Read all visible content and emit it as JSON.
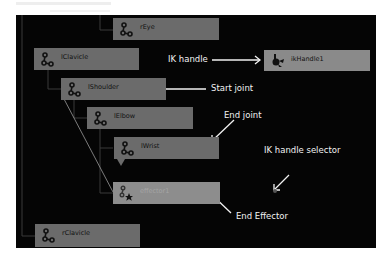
{
  "nodes": {
    "rEye": {
      "label": "rEye",
      "icon": "joint-icon"
    },
    "lClavicle": {
      "label": "lClavicle",
      "icon": "joint-icon"
    },
    "lShoulder": {
      "label": "lShoulder",
      "icon": "joint-icon"
    },
    "lElbow": {
      "label": "lElbow",
      "icon": "joint-icon"
    },
    "lWrist": {
      "label": "lWrist",
      "icon": "joint-icon"
    },
    "effector1": {
      "label": "effector1",
      "icon": "effector-icon"
    },
    "rClavicle": {
      "label": "rClavicle",
      "icon": "joint-icon"
    },
    "ikHandle1": {
      "label": "ikHandle1",
      "icon": "ik-handle-icon"
    }
  },
  "annotations": {
    "ik_handle": "IK handle",
    "start_joint": "Start joint",
    "end_joint": "End joint",
    "ik_handle_selector": "IK handle selector",
    "end_effector": "End Effector"
  },
  "colors": {
    "canvas_bg": "#050505",
    "node_bg": "#6b6b6b",
    "effector_bg": "#8d8d8d",
    "annotation_text": "#f2f2f2"
  }
}
